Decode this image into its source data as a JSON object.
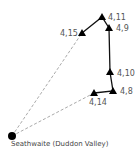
{
  "map": {
    "start": {
      "label": "Seathwaite (Duddon Valley)",
      "x": 12,
      "y": 136
    },
    "summits": [
      {
        "id": "4,15",
        "x": 82,
        "y": 33,
        "label_x": 60,
        "label_y": 36,
        "anchor": "start"
      },
      {
        "id": "4,11",
        "x": 102,
        "y": 17,
        "label_x": 108,
        "label_y": 20,
        "anchor": "start"
      },
      {
        "id": "4,9",
        "x": 109,
        "y": 28,
        "label_x": 116,
        "label_y": 31,
        "anchor": "start"
      },
      {
        "id": "4,10",
        "x": 110,
        "y": 72,
        "label_x": 117,
        "label_y": 76,
        "anchor": "start"
      },
      {
        "id": "4,8",
        "x": 113,
        "y": 91,
        "label_x": 120,
        "label_y": 94,
        "anchor": "start"
      },
      {
        "id": "4,14",
        "x": 94,
        "y": 93,
        "label_x": 89,
        "label_y": 105,
        "anchor": "start"
      }
    ],
    "route_solid": [
      "4,15",
      "4,11",
      "4,9",
      "4,10",
      "4,8",
      "4,14"
    ],
    "route_dashed": [
      [
        "start",
        "4,15"
      ],
      [
        "start",
        "4,14"
      ]
    ],
    "colors": {
      "marker": "#000000",
      "solid_line": "#111111",
      "dashed_line": "#aaaaaa",
      "label": "#555555"
    }
  }
}
